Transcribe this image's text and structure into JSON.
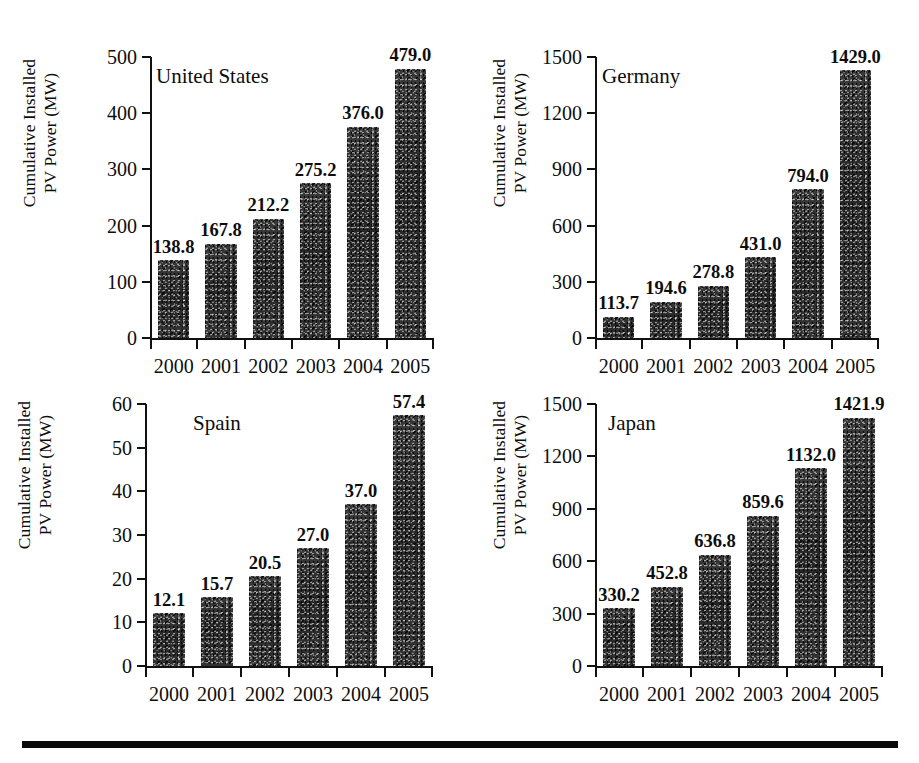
{
  "figure": {
    "background_color": "#ffffff",
    "bar_color": "#2f2f2f",
    "axis_color": "#111111",
    "bottom_rule": "horizontal-rule"
  },
  "axis_caption": {
    "line1": "Cumulative Installed",
    "line2": "PV Power (MW)"
  },
  "chart_data": [
    {
      "type": "bar",
      "title": "United States",
      "xlabel": "",
      "ylabel": "Cumulative Installed PV Power (MW)",
      "categories": [
        "2000",
        "2001",
        "2002",
        "2003",
        "2004",
        "2005"
      ],
      "values": [
        138.8,
        167.8,
        212.2,
        275.2,
        376.0,
        479.0
      ],
      "value_labels": [
        "138.8",
        "167.8",
        "212.2",
        "275.2",
        "376.0",
        "479.0"
      ],
      "ylim": [
        0,
        500
      ],
      "yticks": [
        0,
        100,
        200,
        300,
        400,
        500
      ],
      "ytick_labels": [
        "0",
        "100",
        "200",
        "300",
        "400",
        "500"
      ],
      "grid": false,
      "legend": "none"
    },
    {
      "type": "bar",
      "title": "Germany",
      "xlabel": "",
      "ylabel": "Cumulative Installed PV Power (MW)",
      "categories": [
        "2000",
        "2001",
        "2002",
        "2003",
        "2004",
        "2005"
      ],
      "values": [
        113.7,
        194.6,
        278.8,
        431.0,
        794.0,
        1429.0
      ],
      "value_labels": [
        "113.7",
        "194.6",
        "278.8",
        "431.0",
        "794.0",
        "1429.0"
      ],
      "ylim": [
        0,
        1500
      ],
      "yticks": [
        0,
        300,
        600,
        900,
        1200,
        1500
      ],
      "ytick_labels": [
        "0",
        "300",
        "600",
        "900",
        "1200",
        "1500"
      ],
      "grid": false,
      "legend": "none"
    },
    {
      "type": "bar",
      "title": "Spain",
      "xlabel": "",
      "ylabel": "Cumulative Installed PV Power (MW)",
      "categories": [
        "2000",
        "2001",
        "2002",
        "2003",
        "2004",
        "2005"
      ],
      "values": [
        12.1,
        15.7,
        20.5,
        27.0,
        37.0,
        57.4
      ],
      "value_labels": [
        "12.1",
        "15.7",
        "20.5",
        "27.0",
        "37.0",
        "57.4"
      ],
      "ylim": [
        0,
        60
      ],
      "yticks": [
        0,
        10,
        20,
        30,
        40,
        50,
        60
      ],
      "ytick_labels": [
        "0",
        "10",
        "20",
        "30",
        "40",
        "50",
        "60"
      ],
      "grid": false,
      "legend": "none"
    },
    {
      "type": "bar",
      "title": "Japan",
      "xlabel": "",
      "ylabel": "Cumulative Installed PV Power (MW)",
      "categories": [
        "2000",
        "2001",
        "2002",
        "2003",
        "2004",
        "2005"
      ],
      "values": [
        330.2,
        452.8,
        636.8,
        859.6,
        1132.0,
        1421.9
      ],
      "value_labels": [
        "330.2",
        "452.8",
        "636.8",
        "859.6",
        "1132.0",
        "1421.9"
      ],
      "ylim": [
        0,
        1500
      ],
      "yticks": [
        0,
        300,
        600,
        900,
        1200,
        1500
      ],
      "ytick_labels": [
        "0",
        "300",
        "600",
        "900",
        "1200",
        "1500"
      ],
      "grid": false,
      "legend": "none"
    }
  ]
}
